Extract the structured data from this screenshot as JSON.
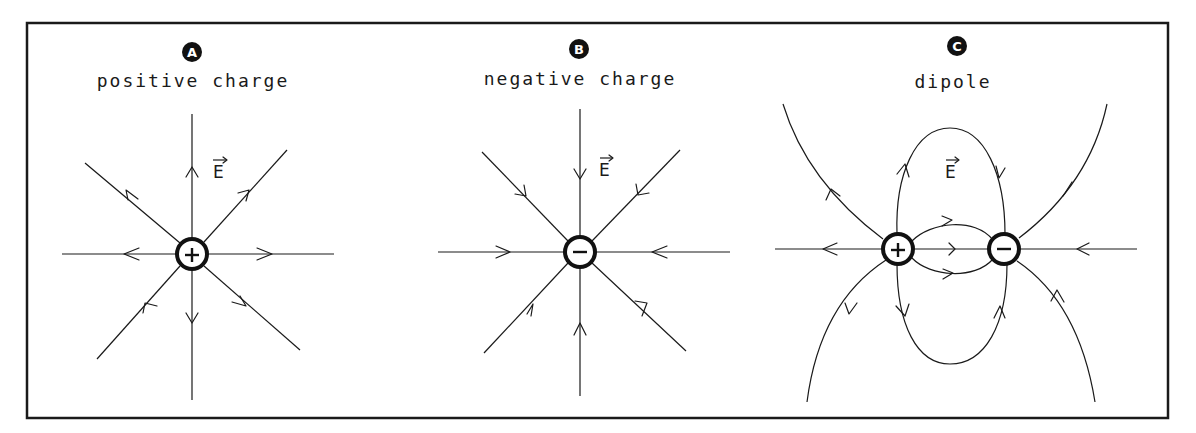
{
  "figure": {
    "panels": [
      {
        "id": "A",
        "badge": "A",
        "title": "positive charge",
        "field_label": "E",
        "charges": [
          {
            "sign": "+"
          }
        ],
        "field_direction": "outward"
      },
      {
        "id": "B",
        "badge": "B",
        "title": "negative charge",
        "field_label": "E",
        "charges": [
          {
            "sign": "−"
          }
        ],
        "field_direction": "inward"
      },
      {
        "id": "C",
        "badge": "C",
        "title": "dipole",
        "field_label": "E",
        "charges": [
          {
            "sign": "+"
          },
          {
            "sign": "−"
          }
        ],
        "field_direction": "from + to −"
      }
    ],
    "colors": {
      "ink": "#1a1a1a",
      "background": "#ffffff",
      "badge_fill": "#111111"
    }
  }
}
